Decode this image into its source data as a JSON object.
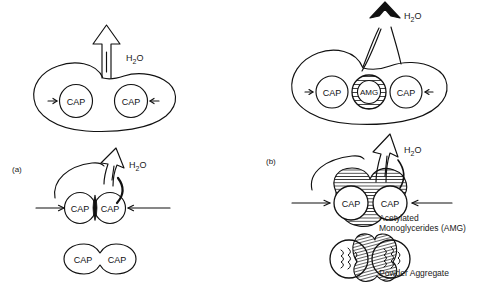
{
  "figure": {
    "title": "",
    "background_color": "#ffffff",
    "line_color": "#111111",
    "panels": [
      {
        "id": "a",
        "label": "(a)",
        "description": "Capsule aggregation without acetylated monoglycerides",
        "stages": [
          {
            "name": "bottom-aggregate",
            "particles": [
              {
                "label": "CAP"
              },
              {
                "label": "CAP"
              }
            ]
          },
          {
            "name": "middle-wetting",
            "particles": [
              {
                "label": "CAP"
              },
              {
                "label": "CAP"
              }
            ],
            "water_label": "H2O",
            "water_label_html": "H₂O"
          },
          {
            "name": "top-dispersed",
            "particles": [
              {
                "label": "CAP"
              },
              {
                "label": "CAP"
              }
            ],
            "water_label": "H2O",
            "water_label_html": "H₂O"
          }
        ]
      },
      {
        "id": "b",
        "label": "(b)",
        "description": "Capsule aggregation with acetylated monoglycerides coating",
        "stages": [
          {
            "name": "bottom-powder-aggregate",
            "caption": "Powder Aggregate",
            "particles": [
              {
                "label": "CAP"
              },
              {
                "label": "CAP"
              }
            ]
          },
          {
            "name": "middle-wetting",
            "caption_line1": "Acetylated",
            "caption_line2": "Monoglycerides (AMG)",
            "particles": [
              {
                "label": "CAP"
              },
              {
                "label": "CAP"
              }
            ],
            "water_label": "H2O",
            "water_label_html": "H₂O"
          },
          {
            "name": "top-dispersed",
            "particles": [
              {
                "label": "CAP"
              },
              {
                "label": "AMG"
              },
              {
                "label": "CAP"
              }
            ],
            "water_label": "H2O",
            "water_label_html": "H₂O"
          }
        ]
      }
    ],
    "legend_terms": {
      "cap": "CAP",
      "amg": "AMG",
      "amg_full": "Acetylated Monoglycerides (AMG)",
      "powder_aggregate": "Powder Aggregate",
      "water": "H₂O"
    }
  }
}
